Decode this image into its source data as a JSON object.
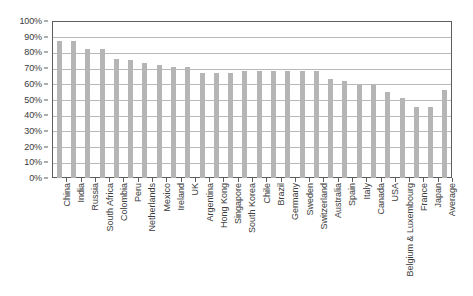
{
  "chart_data": {
    "type": "bar",
    "title": "",
    "subtitle": "",
    "xlabel": "",
    "ylabel": "",
    "ylim": [
      0,
      100
    ],
    "ytick_labels": [
      "100%",
      "90%",
      "80%",
      "70%",
      "60%",
      "50%",
      "40%",
      "30%",
      "20%",
      "10%",
      "0%"
    ],
    "ytick_values": [
      100,
      90,
      80,
      70,
      60,
      50,
      40,
      30,
      20,
      10,
      0
    ],
    "grid": true,
    "legend": null,
    "legend_position": "none",
    "series_name": "",
    "bar_color": "#b5b5b5",
    "categories": [
      "China",
      "India",
      "Russia",
      "South Africa",
      "Colombia",
      "Peru",
      "Netherlands",
      "Mexico",
      "Ireland",
      "UK",
      "Argentina",
      "Hong Kong",
      "Singapore",
      "South Korea",
      "Chile",
      "Brazil",
      "Germany",
      "Sweden",
      "Switzerland",
      "Australia",
      "Spain",
      "Italy",
      "Canada",
      "USA",
      "Belgium & Luxembourg",
      "France",
      "Japan",
      "Average"
    ],
    "values": [
      87,
      87,
      82,
      82,
      76,
      75,
      73,
      72,
      71,
      71,
      67,
      67,
      67,
      68,
      68,
      68,
      68,
      68,
      68,
      63,
      62,
      59,
      59,
      55,
      51,
      45,
      45,
      56
    ]
  }
}
